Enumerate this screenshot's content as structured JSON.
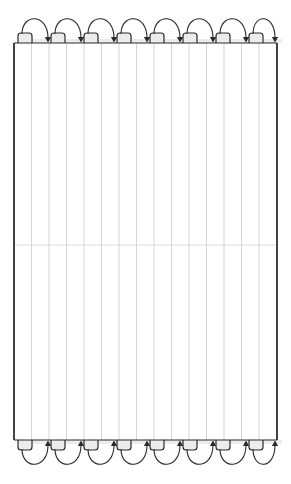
{
  "figure": {
    "canvas": {
      "width": 291,
      "height": 484,
      "background": "#ffffff"
    }
  },
  "colors": {
    "sweep_line": "#c9c9c9",
    "boundary_line": "#1a1a1a",
    "path_line": "#2b2b2b",
    "midline": "#d8d8d8",
    "notch_fill": "#ececec",
    "background": "#ffffff"
  },
  "region": {
    "left": 14,
    "right": 277,
    "top": 43,
    "bottom": 440,
    "midline_y": 245
  },
  "sweep_lines": {
    "count": 16,
    "spacing": 17.5,
    "x_positions": [
      14,
      31.5,
      49,
      66.5,
      84,
      101.5,
      119,
      136.5,
      154,
      171.5,
      189,
      206.5,
      224,
      241.5,
      259,
      277
    ],
    "stroke_width": 0.8
  },
  "turn_units": {
    "count": 8,
    "pitch": 33,
    "first_x": 18,
    "notch_width": 14,
    "notch_height": 10,
    "arc_span": 29,
    "arc_height": 20
  },
  "top_turns": [
    {
      "index": 0,
      "notch_left": 18,
      "notch_right": 32,
      "arrow_x": 48,
      "direction": "down"
    },
    {
      "index": 1,
      "notch_left": 51,
      "notch_right": 65,
      "arrow_x": 81,
      "direction": "down"
    },
    {
      "index": 2,
      "notch_left": 84,
      "notch_right": 98,
      "arrow_x": 114,
      "direction": "down"
    },
    {
      "index": 3,
      "notch_left": 117,
      "notch_right": 131,
      "arrow_x": 147,
      "direction": "down"
    },
    {
      "index": 4,
      "notch_left": 150,
      "notch_right": 164,
      "arrow_x": 180,
      "direction": "down"
    },
    {
      "index": 5,
      "notch_left": 183,
      "notch_right": 197,
      "arrow_x": 213,
      "direction": "down"
    },
    {
      "index": 6,
      "notch_left": 216,
      "notch_right": 230,
      "arrow_x": 246,
      "direction": "down"
    },
    {
      "index": 7,
      "notch_left": 249,
      "notch_right": 263,
      "arrow_x": 275,
      "direction": "down"
    }
  ],
  "bottom_turns": [
    {
      "index": 0,
      "notch_left": 18,
      "notch_right": 32,
      "arrow_x": 48,
      "direction": "up"
    },
    {
      "index": 1,
      "notch_left": 51,
      "notch_right": 65,
      "arrow_x": 81,
      "direction": "up"
    },
    {
      "index": 2,
      "notch_left": 84,
      "notch_right": 98,
      "arrow_x": 114,
      "direction": "up"
    },
    {
      "index": 3,
      "notch_left": 117,
      "notch_right": 131,
      "arrow_x": 147,
      "direction": "up"
    },
    {
      "index": 4,
      "notch_left": 150,
      "notch_right": 164,
      "arrow_x": 180,
      "direction": "up"
    },
    {
      "index": 5,
      "notch_left": 183,
      "notch_right": 197,
      "arrow_x": 213,
      "direction": "up"
    },
    {
      "index": 6,
      "notch_left": 216,
      "notch_right": 230,
      "arrow_x": 246,
      "direction": "up"
    },
    {
      "index": 7,
      "notch_left": 249,
      "notch_right": 263,
      "arrow_x": 275,
      "direction": "up"
    }
  ]
}
